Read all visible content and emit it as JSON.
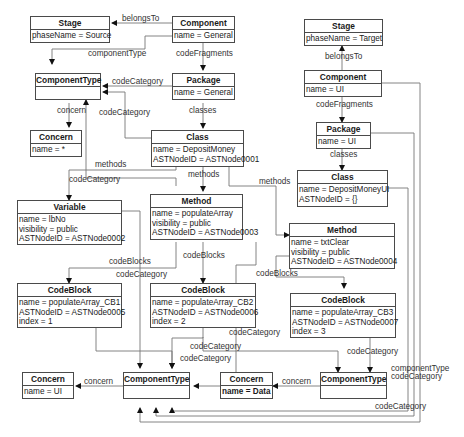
{
  "diagram": {
    "type": "object-diagram",
    "nodes": [
      {
        "id": "stage_src",
        "title": "Stage",
        "attrs": [
          "phaseName = Source"
        ]
      },
      {
        "id": "comp_general",
        "title": "Component",
        "attrs": [
          "name = General"
        ]
      },
      {
        "id": "ctype_top",
        "title": "ComponentType",
        "attrs": []
      },
      {
        "id": "pkg_general",
        "title": "Package",
        "attrs": [
          "name = General"
        ]
      },
      {
        "id": "concern_star",
        "title": "Concern",
        "attrs": [
          "name = *"
        ]
      },
      {
        "id": "class_deposit",
        "title": "Class",
        "attrs": [
          "name = DepositMoney",
          "ASTNodeID = ASTNode0001"
        ]
      },
      {
        "id": "variable",
        "title": "Variable",
        "attrs": [
          "name = lbNo",
          "visibility = public",
          "ASTNodeID = ASTNode0002"
        ]
      },
      {
        "id": "method_populate",
        "title": "Method",
        "attrs": [
          "name = populateArray",
          "visibility = public",
          "ASTNodeID = ASTNode0003"
        ]
      },
      {
        "id": "method_txtclear",
        "title": "Method",
        "attrs": [
          "name = txtClear",
          "visibility = public",
          "ASTNodeID = ASTNode0004"
        ]
      },
      {
        "id": "cb1",
        "title": "CodeBlock",
        "attrs": [
          "name = populateArray_CB1",
          "ASTNodeID = ASTNode0005",
          "index = 1"
        ]
      },
      {
        "id": "cb2",
        "title": "CodeBlock",
        "attrs": [
          "name = populateArray_CB2",
          "ASTNodeID = ASTNode0006",
          "index = 2"
        ]
      },
      {
        "id": "cb3",
        "title": "CodeBlock",
        "attrs": [
          "name = populateArray_CB3",
          "ASTNodeID = ASTNode0007",
          "index = 3"
        ]
      },
      {
        "id": "concern_ui",
        "title": "Concern",
        "attrs": [
          "name = UI"
        ]
      },
      {
        "id": "ctype_ui",
        "title": "ComponentType",
        "attrs": []
      },
      {
        "id": "concern_data",
        "title": "Concern",
        "attrs": [
          "name = Data"
        ]
      },
      {
        "id": "ctype_data",
        "title": "ComponentType",
        "attrs": []
      },
      {
        "id": "stage_tgt",
        "title": "Stage",
        "attrs": [
          "phaseName = Target"
        ]
      },
      {
        "id": "comp_ui",
        "title": "Component",
        "attrs": [
          "name = UI"
        ]
      },
      {
        "id": "pkg_ui",
        "title": "Package",
        "attrs": [
          "name = UI"
        ]
      },
      {
        "id": "class_ui",
        "title": "Class",
        "attrs": [
          "name = DepositMoneyUI",
          "ASTNodeID = {}"
        ]
      }
    ],
    "edge_labels": {
      "belongsTo_src": "belongsTo",
      "componentType_src": "componentType",
      "codeFragments_src": "codeFragments",
      "codeCategory_pkg": "codeCategory",
      "concern_top": "concern",
      "codeCategory_class": "codeCategory",
      "classes_src": "classes",
      "methods_var": "methods",
      "codeCategory_var": "codeCategory",
      "methods_populate": "methods",
      "methods_txtclear": "methods",
      "codeBlocks_cb1": "codeBlocks",
      "codeCategory_var2": "codeCategory",
      "codeBlocks_cb2": "codeBlocks",
      "codeBlocks_cb3": "codeBlocks",
      "codeCategory_cb2a": "codeCategory",
      "codeCategory_cb2b": "codeCategory",
      "codeCategory_cb2c": "codeCategory",
      "concern_ui": "concern",
      "concern_data": "concern",
      "codeCategory_cb3": "codeCategory",
      "belongsTo_tgt": "belongsTo",
      "codeFragments_tgt": "codeFragments",
      "classes_tgt": "classes",
      "componentType_tgt": "componentType",
      "codeCategory_tgt": "codeCategory",
      "codeCategory_bottom": "codeCategory"
    }
  }
}
